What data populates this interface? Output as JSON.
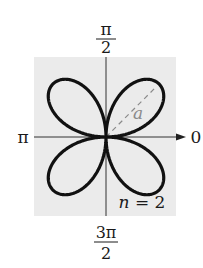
{
  "figure": {
    "type": "polar rose curve",
    "equation_form": "r = a sin(nθ)",
    "n_label": "n = 2",
    "petal_label": "a",
    "petals": 4,
    "colors": {
      "background": "#ffffff",
      "plot_area": "#ebebeb",
      "curve": "#111111",
      "axes": "#333333",
      "dashed_radius": "#8a8a8a",
      "petal_label": "#8a8a8a"
    }
  },
  "axes": {
    "top_label": {
      "numerator": "π",
      "denominator": "2"
    },
    "bottom_label": {
      "numerator": "3π",
      "denominator": "2"
    },
    "left_label": "π",
    "right_label": "0"
  },
  "chart_data": {
    "type": "line",
    "title": "",
    "curve": "rose r = a·sin(2θ)",
    "n": 2,
    "petal_angles_deg": [
      45,
      135,
      225,
      315
    ],
    "angle_labels": [
      "0",
      "π/2",
      "π",
      "3π/2"
    ],
    "annotations": [
      "a",
      "n = 2"
    ],
    "grid": false
  }
}
